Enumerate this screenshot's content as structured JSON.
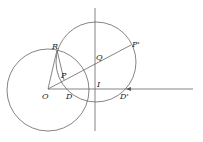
{
  "diagram": {
    "type": "geometric-construction",
    "stroke_color": "#666666",
    "label_color": "#222222",
    "labels": {
      "R": "R",
      "P": "P",
      "Q": "Q",
      "P_prime": "P'",
      "O": "O",
      "D": "D",
      "I": "I",
      "D_prime": "D'"
    },
    "points": {
      "O": [
        48,
        89
      ],
      "R": [
        57,
        50
      ],
      "P": [
        64,
        79
      ],
      "Q": [
        97,
        62
      ],
      "P_prime": [
        131,
        46
      ],
      "D": [
        70,
        89
      ],
      "I": [
        96,
        89
      ],
      "D_prime": [
        124,
        89
      ]
    },
    "circles": [
      {
        "name": "circle-O",
        "cx": 48,
        "cy": 90,
        "r": 41
      },
      {
        "name": "circle-Q",
        "cx": 96,
        "cy": 62,
        "r": 40
      }
    ]
  }
}
